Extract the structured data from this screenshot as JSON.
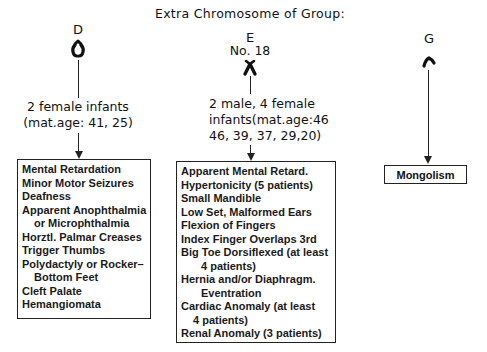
{
  "title": "Extra Chromosome of Group:",
  "groups": [
    {
      "id": "D",
      "label": "D",
      "sublabel": "",
      "caption_lines": [
        "2 female infants",
        "(mat.age: 41, 25)"
      ],
      "findings": [
        "Mental Retardation",
        "Minor Motor Seizures",
        "Deafness",
        "Apparent Anophthalmia",
        "or Microphthalmia",
        "Horztl. Palmar Creases",
        "Trigger Thumbs",
        "Polydactyly or Rocker–",
        "Bottom Feet",
        "Cleft Palate",
        "Hemangiomata"
      ]
    },
    {
      "id": "E",
      "label": "E",
      "sublabel": "No. 18",
      "caption_lines": [
        "2 male, 4 female",
        "infants(mat.age:46",
        "46, 39, 37, 29,20)"
      ],
      "findings": [
        "Apparent Mental Retard.",
        "Hypertonicity (5 patients)",
        "Small Mandible",
        "Low Set, Malformed Ears",
        "Flexion of Fingers",
        "Index Finger Overlaps 3rd",
        "Big Toe Dorsiflexed (at least",
        "4 patients)",
        "Hernia and/or Diaphragm.",
        "Eventration",
        "Cardiac Anomaly (at least",
        "4 patients)",
        "Renal Anomaly (3 patients)"
      ]
    },
    {
      "id": "G",
      "label": "G",
      "sublabel": "",
      "caption_lines": [],
      "findings": [
        "Mongolism"
      ]
    }
  ],
  "colors": {
    "ink": "#111111",
    "background": "#ffffff"
  }
}
